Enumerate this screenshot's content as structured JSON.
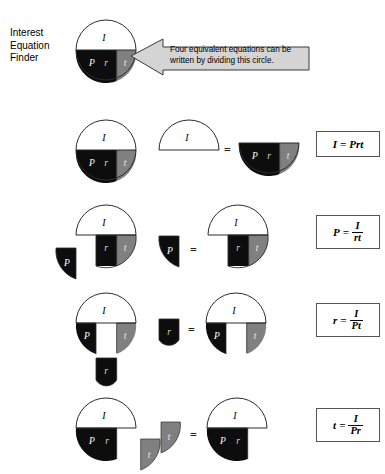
{
  "title": {
    "text": "Interest\nEquation\nFinder"
  },
  "callout": {
    "text": "Four equivalent equations can be written by dividing this circle.",
    "fill": "#d4d4d4",
    "stroke": "#3a3a3a",
    "direction": "left-arrow"
  },
  "colors": {
    "white": "#ffffff",
    "black": "#0d0d0d",
    "gray": "#808080",
    "outline": "#2b2b2b",
    "box_border": "#555555"
  },
  "circle_labels": {
    "top": "I",
    "principal": "P",
    "rate": "r",
    "time": "t"
  },
  "equals_sign": "=",
  "rows": [
    {
      "id": "row-intro",
      "kind": "master-circle",
      "labels": {
        "top": "I",
        "left": "P",
        "mid": "r",
        "right": "t"
      }
    },
    {
      "id": "row-i",
      "solve_for": "I",
      "left_diagram": "full circle with I on top, P r t on bottom",
      "isolated_piece": "I",
      "remainder": "Prt",
      "equation": {
        "lhs": "I",
        "rel": "=",
        "rhs_type": "inline",
        "rhs": "Prt"
      }
    },
    {
      "id": "row-p",
      "solve_for": "P",
      "left_diagram": "circle with P wedge removed to lower left",
      "isolated_piece": "P",
      "remainder": "I over rt",
      "equation": {
        "lhs": "P",
        "rel": "=",
        "rhs_type": "fraction",
        "numerator": "I",
        "denominator": "rt"
      }
    },
    {
      "id": "row-r",
      "solve_for": "r",
      "left_diagram": "circle with r block removed downward",
      "isolated_piece": "r",
      "remainder": "I over Pt",
      "equation": {
        "lhs": "r",
        "rel": "=",
        "rhs_type": "fraction",
        "numerator": "I",
        "denominator": "Pt"
      }
    },
    {
      "id": "row-t",
      "solve_for": "t",
      "left_diagram": "circle with t wedge removed to the right",
      "isolated_piece": "t",
      "remainder": "I over Pr",
      "equation": {
        "lhs": "t",
        "rel": "=",
        "rhs_type": "fraction",
        "numerator": "I",
        "denominator": "Pr"
      }
    }
  ]
}
